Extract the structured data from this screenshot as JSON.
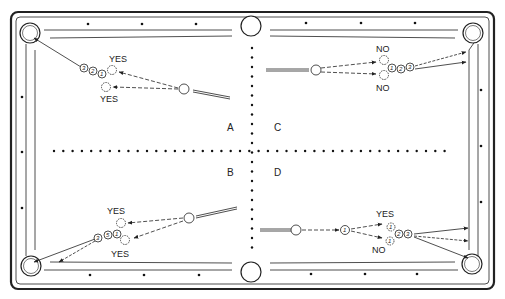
{
  "diagram": {
    "colors": {
      "line": "#222222",
      "background": "#ffffff",
      "diamond": "#111111"
    },
    "quadrants": [
      {
        "id": "A",
        "label": "A",
        "x": 230,
        "y": 130
      },
      {
        "id": "B",
        "label": "B",
        "x": 230,
        "y": 175
      },
      {
        "id": "C",
        "label": "C",
        "x": 276,
        "y": 130
      },
      {
        "id": "D",
        "label": "D",
        "x": 276,
        "y": 175
      }
    ],
    "annotations": {
      "A": {
        "top": "YES",
        "bottom": "YES"
      },
      "B": {
        "top": "YES",
        "bottom": "YES"
      },
      "C": {
        "top": "NO",
        "bottom": "NO"
      },
      "D": {
        "top": "YES",
        "bottom": "NO"
      }
    },
    "balls": {
      "A": [
        "3",
        "2",
        "1"
      ],
      "B": [
        "3",
        "5",
        "1"
      ],
      "C": [
        "1",
        "2",
        "3"
      ],
      "D": [
        "1",
        "2",
        "3"
      ],
      "D_ghost": [
        "1",
        "1"
      ],
      "D_first": "1"
    },
    "pockets": [
      "top-left corner",
      "top-side",
      "top-right corner",
      "bottom-left corner",
      "bottom-side",
      "bottom-right corner"
    ]
  }
}
